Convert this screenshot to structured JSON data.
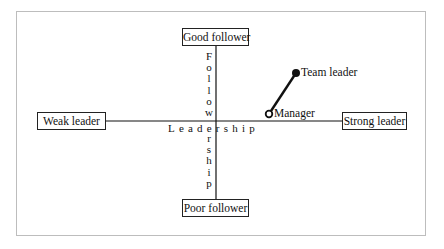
{
  "diagram": {
    "type": "quadrant",
    "boxes": {
      "top": "Good follower",
      "bottom": "Poor follower",
      "left": "Weak leader",
      "right": "Strong leader"
    },
    "axes": {
      "vertical_label": "Followership",
      "horizontal_label": "Leadership"
    },
    "points": [
      {
        "label": "Manager",
        "marker": "open-circle"
      },
      {
        "label": "Team leader",
        "marker": "filled-circle"
      }
    ],
    "colors": {
      "line": "#111111",
      "frame": "#bdbdbd",
      "background": "#ffffff"
    }
  }
}
